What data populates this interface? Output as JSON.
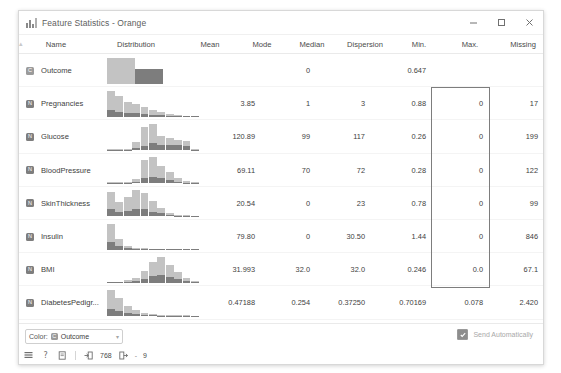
{
  "window": {
    "title": "Feature Statistics - Orange",
    "app_icon": "bar-chart-icon",
    "controls": {
      "minimize": "minimize-icon",
      "maximize": "maximize-icon",
      "close": "close-icon"
    }
  },
  "table": {
    "sort_indicator": "▴",
    "columns": [
      {
        "key": "name",
        "label": "Name"
      },
      {
        "key": "distribution",
        "label": "Distribution"
      },
      {
        "key": "mean",
        "label": "Mean"
      },
      {
        "key": "mode",
        "label": "Mode"
      },
      {
        "key": "median",
        "label": "Median"
      },
      {
        "key": "dispersion",
        "label": "Dispersion"
      },
      {
        "key": "min",
        "label": "Min."
      },
      {
        "key": "max",
        "label": "Max."
      },
      {
        "key": "missing",
        "label": "Missing"
      }
    ],
    "rows": [
      {
        "type_icon": "categorical-variable-icon",
        "type_glyph": "C",
        "name": "Outcome",
        "mean": "",
        "mode": "0",
        "median": "",
        "dispersion": "0.647",
        "min": "",
        "max": "",
        "missing": "0 (0 %)"
      },
      {
        "type_icon": "numeric-variable-icon",
        "type_glyph": "N",
        "name": "Pregnancies",
        "mean": "3.85",
        "mode": "1",
        "median": "3",
        "dispersion": "0.88",
        "min": "0",
        "max": "17",
        "missing": "0 (0 %)"
      },
      {
        "type_icon": "numeric-variable-icon",
        "type_glyph": "N",
        "name": "Glucose",
        "mean": "120.89",
        "mode": "99",
        "median": "117",
        "dispersion": "0.26",
        "min": "0",
        "max": "199",
        "missing": "0 (0 %)"
      },
      {
        "type_icon": "numeric-variable-icon",
        "type_glyph": "N",
        "name": "BloodPressure",
        "mean": "69.11",
        "mode": "70",
        "median": "72",
        "dispersion": "0.28",
        "min": "0",
        "max": "122",
        "missing": "0 (0 %)"
      },
      {
        "type_icon": "numeric-variable-icon",
        "type_glyph": "N",
        "name": "SkinThickness",
        "mean": "20.54",
        "mode": "0",
        "median": "23",
        "dispersion": "0.78",
        "min": "0",
        "max": "99",
        "missing": "0 (0 %)"
      },
      {
        "type_icon": "numeric-variable-icon",
        "type_glyph": "N",
        "name": "Insulin",
        "mean": "79.80",
        "mode": "0",
        "median": "30.50",
        "dispersion": "1.44",
        "min": "0",
        "max": "846",
        "missing": "0 (0 %)"
      },
      {
        "type_icon": "numeric-variable-icon",
        "type_glyph": "N",
        "name": "BMI",
        "mean": "31.993",
        "mode": "32.0",
        "median": "32.0",
        "dispersion": "0.246",
        "min": "0.0",
        "max": "67.1",
        "missing": "0 (0 %)"
      },
      {
        "type_icon": "numeric-variable-icon",
        "type_glyph": "N",
        "name": "DiabetesPedigr...",
        "mean": "0.47188",
        "mode": "0.254",
        "median": "0.37250",
        "dispersion": "0.70169",
        "min": "0.078",
        "max": "2.420",
        "missing": "0 (0 %)"
      }
    ],
    "selection": {
      "column": "min",
      "first_row_index": 1,
      "last_row_index": 6,
      "border_color": "#7d7d7d"
    }
  },
  "chart_data": {
    "type": "bar",
    "title": "Distribution",
    "stacked": true,
    "legend": [
      "Outcome = 0",
      "Outcome = 1"
    ],
    "colors": {
      "light": "#c3c3c3",
      "dark": "#7d7d7d"
    },
    "charts": [
      {
        "variable": "Outcome",
        "categories": [
          "0",
          "1"
        ],
        "series": [
          {
            "name": "Outcome = 0",
            "values": [
              26,
              0
            ]
          },
          {
            "name": "Outcome = 1",
            "values": [
              0,
              15
            ]
          }
        ],
        "bar_widths": [
          28,
          28
        ],
        "bar_gap": 0
      },
      {
        "variable": "Pregnancies",
        "categories": [
          "0",
          "1",
          "2",
          "3",
          "4",
          "5",
          "6",
          "7",
          "8",
          "9",
          "10"
        ],
        "series": [
          {
            "name": "light",
            "values": [
              17,
              14,
              10,
              8,
              6,
              4,
              2.5,
              1.6,
              1.0,
              0.6,
              0.4
            ]
          },
          {
            "name": "dark",
            "values": [
              6,
              4.5,
              3.5,
              3,
              2.5,
              2,
              1.5,
              1.0,
              0.6,
              0.4,
              0.3
            ]
          }
        ]
      },
      {
        "variable": "Glucose",
        "categories": [
          "0",
          "1",
          "2",
          "3",
          "4",
          "5",
          "6",
          "7",
          "8",
          "9",
          "10"
        ],
        "series": [
          {
            "name": "light",
            "values": [
              0.4,
              0.3,
              0.6,
              5,
              17,
              18,
              8,
              6,
              5,
              4,
              0.5
            ]
          },
          {
            "name": "dark",
            "values": [
              0.3,
              0.2,
              0.4,
              2,
              4,
              6,
              5,
              5,
              4.5,
              4,
              0.4
            ]
          }
        ]
      },
      {
        "variable": "BloodPressure",
        "categories": [
          "0",
          "1",
          "2",
          "3",
          "4",
          "5",
          "6",
          "7",
          "8",
          "9",
          "10"
        ],
        "series": [
          {
            "name": "light",
            "values": [
              0.5,
              0.4,
              0.5,
              2,
              16,
              18,
              11,
              7,
              3,
              1,
              0.5
            ]
          },
          {
            "name": "dark",
            "values": [
              0.4,
              0.3,
              0.4,
              1.5,
              5,
              6,
              4.5,
              3,
              1.5,
              0.6,
              0.3
            ]
          }
        ]
      },
      {
        "variable": "SkinThickness",
        "categories": [
          "0",
          "1",
          "2",
          "3",
          "4",
          "5",
          "6",
          "7",
          "8",
          "9",
          "10"
        ],
        "series": [
          {
            "name": "light",
            "values": [
              15,
              9,
              12,
              16,
              14,
              9,
              5,
              2,
              0.8,
              0.5,
              0.4
            ]
          },
          {
            "name": "dark",
            "values": [
              6,
              3.5,
              5,
              6.5,
              6,
              4,
              2.5,
              1.2,
              0.5,
              0.4,
              0.3
            ]
          }
        ]
      },
      {
        "variable": "Insulin",
        "categories": [
          "0",
          "1",
          "2",
          "3",
          "4",
          "5",
          "6",
          "7",
          "8",
          "9",
          "10"
        ],
        "series": [
          {
            "name": "light",
            "values": [
              18,
              7,
              2,
              1.2,
              0.8,
              0.6,
              0.5,
              0.4,
              0.3,
              0.3,
              0.2
            ]
          },
          {
            "name": "dark",
            "values": [
              7,
              3,
              1.2,
              0.7,
              0.5,
              0.4,
              0.3,
              0.3,
              0.2,
              0.2,
              0.2
            ]
          }
        ]
      },
      {
        "variable": "BMI",
        "categories": [
          "0",
          "1",
          "2",
          "3",
          "4",
          "5",
          "6",
          "7",
          "8",
          "9",
          "10"
        ],
        "series": [
          {
            "name": "light",
            "values": [
              0.5,
              0.4,
              2,
              3,
              8,
              14,
              18,
              12,
              7,
              3,
              1
            ]
          },
          {
            "name": "dark",
            "values": [
              0.4,
              0.3,
              1,
              1.5,
              3.5,
              6,
              7,
              5.5,
              3.5,
              1.5,
              0.6
            ]
          }
        ]
      },
      {
        "variable": "DiabetesPedigr...",
        "categories": [
          "0",
          "1",
          "2",
          "3",
          "4",
          "5",
          "6",
          "7",
          "8",
          "9",
          "10"
        ],
        "series": [
          {
            "name": "light",
            "values": [
              18,
              12,
              7,
              4,
              2,
              1.2,
              0.8,
              0.5,
              0.4,
              0.3,
              0.2
            ]
          },
          {
            "name": "dark",
            "values": [
              7,
              5,
              3,
              1.8,
              1,
              0.6,
              0.4,
              0.3,
              0.2,
              0.2,
              0.2
            ]
          }
        ]
      }
    ]
  },
  "bottom": {
    "color_label": "Color:",
    "color_value": "Outcome",
    "color_value_icon": "categorical-variable-icon",
    "caret": "▾",
    "send_automatically_label": "Send Automatically",
    "send_automatically_checked": true
  },
  "status": {
    "icons": [
      "report-icon",
      "help-icon",
      "copy-icon"
    ],
    "input_icon": "input-arrow-icon",
    "input_count": "768",
    "output_icon": "output-arrow-icon",
    "output_separator": "-",
    "output_count": "9"
  }
}
